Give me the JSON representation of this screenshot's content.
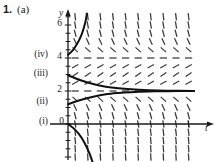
{
  "figure": {
    "problem_number": "1.",
    "part_label": "(a)",
    "type": "slope-field-with-solution-curves"
  },
  "axes": {
    "y_axis_name": "y",
    "t_axis_name": "t",
    "y_ticks": [
      {
        "label": "6",
        "value": 6
      },
      {
        "label": "4",
        "value": 4
      },
      {
        "label": "2",
        "value": 2
      },
      {
        "label": "0",
        "value": 0
      }
    ],
    "t_ticks": []
  },
  "curve_labels": [
    {
      "id": "iv",
      "label": "(iv)",
      "y_start": 4.2
    },
    {
      "id": "iii",
      "label": "(iii)",
      "y_start": 2.95
    },
    {
      "id": "ii",
      "label": "(ii)",
      "y_start": 1.2
    },
    {
      "id": "i",
      "label": "(i)",
      "y_start": 0.0
    }
  ],
  "chart_data": {
    "type": "line",
    "title": "",
    "xlabel": "t",
    "ylabel": "y",
    "xlim": [
      0,
      7
    ],
    "ylim": [
      -3.2,
      6.8
    ],
    "grid": false,
    "legend": "none",
    "equilibria": [
      {
        "y": 2,
        "stability": "stable"
      },
      {
        "y": 4,
        "stability": "unstable"
      }
    ],
    "slope_field": {
      "description": "dy/dt = -(y-2)(y-4); slopes negative for 2<y<4, positive for y<2, steeply positive for y>4, steeply negative for y<0",
      "t_samples": [
        0.4,
        1.1,
        1.8,
        2.5,
        3.2,
        3.9,
        4.6,
        5.3,
        6.0,
        6.7
      ],
      "y_samples": [
        -3.0,
        -2.5,
        -2.0,
        -1.5,
        -1.0,
        -0.5,
        0.0,
        0.5,
        1.0,
        1.5,
        2.0,
        2.5,
        3.0,
        3.5,
        4.0,
        4.5,
        5.0,
        5.5,
        6.0,
        6.5
      ]
    },
    "series": [
      {
        "name": "(i)",
        "initial_value": 0.0,
        "points": [
          [
            0,
            0
          ],
          [
            0.3,
            -0.25
          ],
          [
            0.6,
            -0.6
          ],
          [
            0.9,
            -1.1
          ],
          [
            1.2,
            -1.8
          ],
          [
            1.45,
            -2.6
          ],
          [
            1.6,
            -3.2
          ]
        ]
      },
      {
        "name": "(ii)",
        "initial_value": 1.2,
        "points": [
          [
            0,
            1.2
          ],
          [
            0.7,
            1.45
          ],
          [
            1.4,
            1.65
          ],
          [
            2.1,
            1.8
          ],
          [
            2.8,
            1.88
          ],
          [
            3.5,
            1.93
          ],
          [
            4.5,
            1.97
          ],
          [
            5.5,
            1.99
          ],
          [
            7,
            2.0
          ]
        ]
      },
      {
        "name": "(iii)",
        "initial_value": 2.95,
        "points": [
          [
            0,
            2.95
          ],
          [
            0.7,
            2.65
          ],
          [
            1.4,
            2.42
          ],
          [
            2.1,
            2.26
          ],
          [
            2.8,
            2.16
          ],
          [
            3.5,
            2.1
          ],
          [
            4.5,
            2.05
          ],
          [
            5.5,
            2.02
          ],
          [
            7,
            2.0
          ]
        ]
      },
      {
        "name": "(iv)",
        "initial_value": 4.2,
        "points": [
          [
            0,
            4.2
          ],
          [
            0.25,
            4.45
          ],
          [
            0.5,
            4.85
          ],
          [
            0.75,
            5.4
          ],
          [
            0.95,
            6.1
          ],
          [
            1.05,
            6.7
          ]
        ]
      }
    ]
  },
  "colors": {
    "ink": "#1a1a1a",
    "field_mark": "#3a3a3a",
    "curve": "#111111",
    "background": "#ffffff"
  }
}
